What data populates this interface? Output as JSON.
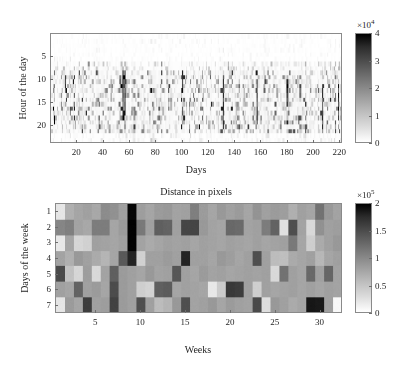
{
  "figure": {
    "background": "#ffffff",
    "colormap": "grayscale-inverted"
  },
  "chart_data": [
    {
      "id": "top-heatmap",
      "type": "heatmap",
      "title": "",
      "xlabel": "Days",
      "ylabel": "Hour of the day",
      "xlim": [
        0,
        222
      ],
      "ylim": [
        0,
        24
      ],
      "xticks": [
        20,
        40,
        60,
        80,
        100,
        120,
        140,
        160,
        180,
        200,
        220
      ],
      "xticklabels": [
        "20",
        "40",
        "60",
        "80",
        "100",
        "120",
        "140",
        "160",
        "180",
        "200",
        "220"
      ],
      "yticks": [
        5,
        10,
        15,
        20
      ],
      "yticklabels": [
        "5",
        "10",
        "15",
        "20"
      ],
      "grid": false,
      "nx": 222,
      "ny": 24,
      "colorbar": {
        "label": "",
        "exponent_text": "×10",
        "exponent_sup": "4",
        "multiplier": 10000,
        "vmin": 0,
        "vmax": 4,
        "ticks": [
          0,
          1,
          2,
          3,
          4
        ],
        "ticklabels": [
          "0",
          "1",
          "2",
          "3",
          "4"
        ],
        "orientation": "vertical",
        "position": "right",
        "high_color": "#000000",
        "low_color": "#ffffff"
      },
      "description": "Sparse vertical streak pattern: most cells near 0 (white); dark activity concentrated between hours 8 and 21 across all 222 days, with strongest bursts near days 55, 100 and 207."
    },
    {
      "id": "bottom-heatmap",
      "type": "heatmap",
      "title": "Distance in pixels",
      "xlabel": "Weeks",
      "ylabel": "Days of the week",
      "xlim": [
        0.5,
        32.5
      ],
      "ylim": [
        0.5,
        7.5
      ],
      "xticks": [
        5,
        10,
        15,
        20,
        25,
        30
      ],
      "xticklabels": [
        "5",
        "10",
        "15",
        "20",
        "25",
        "30"
      ],
      "yticks": [
        1,
        2,
        3,
        4,
        5,
        6,
        7
      ],
      "yticklabels": [
        "1",
        "2",
        "3",
        "4",
        "5",
        "6",
        "7"
      ],
      "grid": false,
      "nx": 32,
      "ny": 7,
      "colorbar": {
        "label": "",
        "exponent_text": "×10",
        "exponent_sup": "5",
        "multiplier": 100000,
        "vmin": 0,
        "vmax": 2,
        "ticks": [
          0,
          0.5,
          1,
          1.5,
          2
        ],
        "ticklabels": [
          "0",
          "0.5",
          "1",
          "1.5",
          "2"
        ],
        "orientation": "vertical",
        "position": "right",
        "high_color": "#000000",
        "low_color": "#ffffff"
      },
      "rows": [
        {
          "day": "1",
          "values": [
            0.2,
            0.62,
            0.7,
            0.74,
            0.68,
            0.9,
            0.86,
            0.74,
            1.95,
            0.76,
            0.7,
            0.78,
            0.8,
            0.72,
            0.74,
            1.0,
            0.78,
            0.7,
            0.8,
            0.74,
            0.78,
            0.7,
            0.84,
            0.74,
            0.78,
            0.76,
            0.62,
            0.74,
            0.7,
            1.1,
            0.8,
            0.72
          ]
        },
        {
          "day": "2",
          "values": [
            0.95,
            1.0,
            0.72,
            0.68,
            1.02,
            1.02,
            0.7,
            0.78,
            1.98,
            1.05,
            0.74,
            1.25,
            1.22,
            0.74,
            1.45,
            1.46,
            0.8,
            0.72,
            0.7,
            1.18,
            1.16,
            0.72,
            0.74,
            1.02,
            1.22,
            0.24,
            1.38,
            0.72,
            0.3,
            0.86,
            0.74,
            0.76
          ]
        },
        {
          "day": "3",
          "values": [
            0.18,
            0.7,
            0.32,
            0.36,
            0.74,
            0.72,
            0.7,
            0.74,
            1.98,
            0.72,
            0.66,
            0.7,
            0.74,
            0.72,
            0.74,
            0.7,
            0.74,
            0.72,
            0.7,
            0.74,
            0.72,
            0.7,
            0.74,
            0.7,
            0.72,
            0.74,
            1.05,
            0.7,
            0.38,
            0.66,
            0.74,
            0.8
          ]
        },
        {
          "day": "4",
          "values": [
            0.72,
            0.62,
            0.8,
            0.74,
            0.66,
            0.58,
            0.7,
            1.3,
            1.72,
            0.36,
            0.74,
            0.74,
            0.78,
            0.74,
            1.72,
            0.74,
            0.74,
            0.7,
            0.8,
            0.76,
            0.7,
            0.74,
            1.38,
            0.74,
            0.52,
            0.5,
            0.66,
            0.7,
            0.74,
            0.56,
            0.7,
            0.74
          ]
        },
        {
          "day": "5",
          "values": [
            1.42,
            0.48,
            0.32,
            0.76,
            0.3,
            0.72,
            1.25,
            0.78,
            0.74,
            0.7,
            0.8,
            0.72,
            0.74,
            1.32,
            0.74,
            0.7,
            0.78,
            0.72,
            0.74,
            0.7,
            0.72,
            0.74,
            0.72,
            0.74,
            0.3,
            1.1,
            0.74,
            0.7,
            1.18,
            0.74,
            1.2,
            0.72
          ]
        },
        {
          "day": "6",
          "values": [
            0.74,
            0.7,
            1.22,
            0.74,
            0.78,
            0.7,
            1.4,
            0.78,
            0.74,
            0.38,
            0.34,
            1.25,
            1.28,
            0.7,
            0.74,
            0.72,
            0.7,
            0.18,
            0.4,
            1.55,
            1.52,
            0.74,
            0.38,
            0.74,
            0.7,
            0.72,
            0.74,
            0.7,
            0.74,
            0.7,
            0.74,
            0.72
          ]
        },
        {
          "day": "7",
          "values": [
            0.2,
            0.78,
            0.7,
            1.52,
            0.74,
            0.76,
            1.48,
            0.78,
            0.74,
            1.38,
            0.74,
            0.52,
            0.58,
            0.8,
            1.38,
            0.72,
            0.74,
            0.8,
            0.7,
            0.78,
            0.74,
            0.72,
            1.42,
            0.26,
            0.8,
            0.74,
            0.66,
            0.7,
            1.82,
            1.8,
            0.74,
            0.05
          ]
        }
      ],
      "description": "32 weeks x 7 days of the week, mid-gray baseline around 0.7e5 with scattered dark cells up to 2e5 and a few very light cells near 0."
    }
  ]
}
